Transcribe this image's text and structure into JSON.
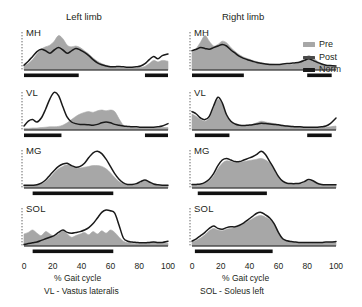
{
  "titles": {
    "left": "Left limb",
    "right": "Right limb"
  },
  "axis": {
    "xlabel": "% Gait cycle",
    "ticks": [
      "0",
      "20",
      "40",
      "60",
      "80",
      "100"
    ],
    "xlim": [
      0,
      100
    ]
  },
  "legend": {
    "position": "right",
    "items": [
      {
        "label": "Pre",
        "color": "#a7a7a7",
        "style": "filled-area"
      },
      {
        "label": "Post",
        "color": "#4a4a4a",
        "style": "line"
      },
      {
        "label": "Norm",
        "color": "#1a1a1a",
        "style": "bar"
      }
    ]
  },
  "footnotes": {
    "vl": "VL - Vastus lateralis",
    "sol": "SOL - Soleus left"
  },
  "muscles": [
    "MH",
    "VL",
    "MG",
    "SOL"
  ],
  "chart_data": {
    "type": "area",
    "xlabel": "% Gait cycle",
    "ylabel": "",
    "xlim": [
      0,
      100
    ],
    "ylim": [
      0,
      1
    ],
    "grid": false,
    "legend": [
      "Pre",
      "Post",
      "Norm"
    ],
    "panels": [
      {
        "muscle": "MH",
        "limb": "Left limb",
        "x": [
          0,
          3,
          6,
          9,
          12,
          15,
          18,
          21,
          24,
          27,
          30,
          33,
          36,
          39,
          42,
          45,
          48,
          51,
          54,
          57,
          60,
          63,
          66,
          69,
          72,
          75,
          78,
          81,
          84,
          87,
          90,
          93,
          96,
          100
        ],
        "series": [
          {
            "name": "Pre",
            "values": [
              0.1,
              0.16,
              0.26,
              0.4,
              0.52,
              0.58,
              0.62,
              0.72,
              0.86,
              0.78,
              0.62,
              0.58,
              0.6,
              0.56,
              0.48,
              0.4,
              0.3,
              0.22,
              0.16,
              0.12,
              0.09,
              0.07,
              0.06,
              0.05,
              0.05,
              0.05,
              0.05,
              0.06,
              0.09,
              0.16,
              0.24,
              0.2,
              0.24,
              0.22
            ]
          },
          {
            "name": "Post",
            "values": [
              0.12,
              0.22,
              0.34,
              0.46,
              0.52,
              0.48,
              0.42,
              0.5,
              0.56,
              0.5,
              0.42,
              0.48,
              0.54,
              0.5,
              0.44,
              0.36,
              0.26,
              0.18,
              0.13,
              0.1,
              0.08,
              0.08,
              0.09,
              0.08,
              0.07,
              0.07,
              0.08,
              0.1,
              0.16,
              0.26,
              0.34,
              0.28,
              0.36,
              0.4
            ]
          }
        ],
        "norm_bars": [
          [
            0,
            38
          ],
          [
            84,
            100
          ]
        ]
      },
      {
        "muscle": "VL",
        "limb": "Left limb",
        "x": [
          0,
          3,
          6,
          9,
          12,
          15,
          18,
          21,
          24,
          27,
          30,
          33,
          36,
          39,
          42,
          45,
          48,
          51,
          54,
          57,
          60,
          63,
          66,
          69,
          72,
          75,
          78,
          81,
          84,
          87,
          90,
          93,
          96,
          100
        ],
        "series": [
          {
            "name": "Pre",
            "values": [
              0.04,
              0.04,
              0.05,
              0.05,
              0.06,
              0.07,
              0.08,
              0.08,
              0.09,
              0.12,
              0.18,
              0.26,
              0.34,
              0.4,
              0.44,
              0.46,
              0.44,
              0.48,
              0.5,
              0.48,
              0.5,
              0.46,
              0.28,
              0.12,
              0.07,
              0.06,
              0.05,
              0.05,
              0.05,
              0.05,
              0.05,
              0.05,
              0.06,
              0.06
            ]
          },
          {
            "name": "Post",
            "values": [
              0.1,
              0.22,
              0.26,
              0.2,
              0.3,
              0.52,
              0.78,
              0.94,
              0.86,
              0.58,
              0.32,
              0.2,
              0.16,
              0.14,
              0.14,
              0.13,
              0.12,
              0.14,
              0.18,
              0.2,
              0.18,
              0.14,
              0.12,
              0.1,
              0.09,
              0.08,
              0.08,
              0.07,
              0.07,
              0.07,
              0.07,
              0.08,
              0.1,
              0.16
            ]
          }
        ],
        "norm_bars": [
          [
            0,
            26
          ],
          [
            84,
            100
          ]
        ]
      },
      {
        "muscle": "MG",
        "limb": "Left limb",
        "x": [
          0,
          3,
          6,
          9,
          12,
          15,
          18,
          21,
          24,
          27,
          30,
          33,
          36,
          39,
          42,
          45,
          48,
          51,
          54,
          57,
          60,
          63,
          66,
          69,
          72,
          75,
          78,
          81,
          84,
          87,
          90,
          93,
          96,
          100
        ],
        "series": [
          {
            "name": "Pre",
            "values": [
              0.06,
              0.06,
              0.06,
              0.07,
              0.1,
              0.16,
              0.26,
              0.38,
              0.48,
              0.54,
              0.58,
              0.54,
              0.5,
              0.5,
              0.52,
              0.54,
              0.56,
              0.56,
              0.54,
              0.48,
              0.38,
              0.26,
              0.16,
              0.1,
              0.08,
              0.08,
              0.1,
              0.14,
              0.18,
              0.14,
              0.09,
              0.07,
              0.06,
              0.06
            ]
          },
          {
            "name": "Post",
            "values": [
              0.07,
              0.07,
              0.07,
              0.08,
              0.12,
              0.2,
              0.32,
              0.44,
              0.54,
              0.6,
              0.62,
              0.56,
              0.52,
              0.54,
              0.62,
              0.76,
              0.88,
              0.92,
              0.86,
              0.72,
              0.54,
              0.36,
              0.22,
              0.13,
              0.09,
              0.09,
              0.11,
              0.16,
              0.2,
              0.15,
              0.1,
              0.08,
              0.07,
              0.07
            ]
          }
        ],
        "norm_bars": [
          [
            6,
            62
          ]
        ]
      },
      {
        "muscle": "SOL",
        "limb": "Left limb",
        "x": [
          0,
          3,
          6,
          9,
          12,
          15,
          18,
          21,
          24,
          27,
          30,
          33,
          36,
          39,
          42,
          45,
          48,
          51,
          54,
          57,
          60,
          63,
          66,
          69,
          72,
          75,
          78,
          81,
          84,
          87,
          90,
          93,
          96,
          100
        ],
        "series": [
          {
            "name": "Pre",
            "values": [
              0.3,
              0.34,
              0.4,
              0.32,
              0.26,
              0.36,
              0.3,
              0.24,
              0.3,
              0.38,
              0.3,
              0.22,
              0.26,
              0.3,
              0.34,
              0.28,
              0.36,
              0.3,
              0.38,
              0.32,
              0.4,
              0.34,
              0.22,
              0.12,
              0.08,
              0.07,
              0.06,
              0.06,
              0.06,
              0.08,
              0.1,
              0.08,
              0.07,
              0.07
            ]
          },
          {
            "name": "Post",
            "values": [
              0.04,
              0.06,
              0.08,
              0.1,
              0.14,
              0.18,
              0.22,
              0.26,
              0.34,
              0.4,
              0.34,
              0.32,
              0.34,
              0.36,
              0.4,
              0.46,
              0.56,
              0.7,
              0.84,
              0.9,
              0.88,
              0.82,
              0.52,
              0.2,
              0.12,
              0.1,
              0.09,
              0.08,
              0.08,
              0.09,
              0.1,
              0.09,
              0.09,
              0.12
            ]
          }
        ],
        "norm_bars": [
          [
            6,
            62
          ]
        ]
      },
      {
        "muscle": "MH",
        "limb": "Right limb",
        "x": [
          0,
          3,
          6,
          9,
          12,
          15,
          18,
          21,
          24,
          27,
          30,
          33,
          36,
          39,
          42,
          45,
          48,
          51,
          54,
          57,
          60,
          63,
          66,
          69,
          72,
          75,
          78,
          81,
          84,
          87,
          90,
          93,
          96,
          100
        ],
        "series": [
          {
            "name": "Pre",
            "values": [
              0.44,
              0.54,
              0.7,
              0.86,
              0.72,
              0.6,
              0.64,
              0.72,
              0.68,
              0.56,
              0.46,
              0.38,
              0.32,
              0.28,
              0.24,
              0.21,
              0.18,
              0.16,
              0.15,
              0.14,
              0.13,
              0.13,
              0.13,
              0.14,
              0.16,
              0.2,
              0.28,
              0.36,
              0.3,
              0.22,
              0.16,
              0.12,
              0.1,
              0.09
            ]
          },
          {
            "name": "Post",
            "values": [
              0.48,
              0.52,
              0.56,
              0.54,
              0.52,
              0.56,
              0.6,
              0.64,
              0.6,
              0.5,
              0.42,
              0.34,
              0.29,
              0.25,
              0.22,
              0.19,
              0.17,
              0.15,
              0.14,
              0.14,
              0.14,
              0.15,
              0.16,
              0.17,
              0.18,
              0.2,
              0.24,
              0.28,
              0.24,
              0.19,
              0.15,
              0.12,
              0.11,
              0.1
            ]
          }
        ],
        "norm_bars": [
          [
            0,
            36
          ],
          [
            80,
            97
          ]
        ]
      },
      {
        "muscle": "VL",
        "limb": "Right limb",
        "x": [
          0,
          3,
          6,
          9,
          12,
          15,
          18,
          21,
          24,
          27,
          30,
          33,
          36,
          39,
          42,
          45,
          48,
          51,
          54,
          57,
          60,
          63,
          66,
          69,
          72,
          75,
          78,
          81,
          84,
          87,
          90,
          93,
          96,
          100
        ],
        "series": [
          {
            "name": "Pre",
            "values": [
              0.4,
              0.34,
              0.26,
              0.22,
              0.3,
              0.54,
              0.76,
              0.64,
              0.36,
              0.2,
              0.14,
              0.12,
              0.11,
              0.12,
              0.14,
              0.18,
              0.22,
              0.2,
              0.18,
              0.16,
              0.14,
              0.12,
              0.1,
              0.09,
              0.08,
              0.07,
              0.07,
              0.06,
              0.06,
              0.06,
              0.06,
              0.07,
              0.08,
              0.1
            ]
          },
          {
            "name": "Post",
            "values": [
              0.46,
              0.4,
              0.3,
              0.26,
              0.34,
              0.6,
              0.82,
              0.68,
              0.38,
              0.22,
              0.15,
              0.12,
              0.11,
              0.12,
              0.13,
              0.15,
              0.17,
              0.16,
              0.15,
              0.14,
              0.13,
              0.11,
              0.1,
              0.09,
              0.08,
              0.08,
              0.07,
              0.07,
              0.07,
              0.07,
              0.08,
              0.1,
              0.16,
              0.3
            ]
          }
        ],
        "norm_bars": [
          [
            2,
            26
          ],
          [
            80,
            97
          ]
        ]
      },
      {
        "muscle": "MG",
        "limb": "Right limb",
        "x": [
          0,
          3,
          6,
          9,
          12,
          15,
          18,
          21,
          24,
          27,
          30,
          33,
          36,
          39,
          42,
          45,
          48,
          51,
          54,
          57,
          60,
          63,
          66,
          69,
          72,
          75,
          78,
          81,
          84,
          87,
          90,
          93,
          96,
          100
        ],
        "series": [
          {
            "name": "Pre",
            "values": [
              0.08,
              0.08,
              0.09,
              0.12,
              0.18,
              0.3,
              0.48,
              0.62,
              0.68,
              0.66,
              0.64,
              0.64,
              0.66,
              0.68,
              0.7,
              0.72,
              0.74,
              0.7,
              0.62,
              0.46,
              0.28,
              0.16,
              0.11,
              0.1,
              0.1,
              0.11,
              0.14,
              0.18,
              0.16,
              0.11,
              0.08,
              0.07,
              0.07,
              0.07
            ]
          },
          {
            "name": "Post",
            "values": [
              0.09,
              0.09,
              0.1,
              0.14,
              0.22,
              0.36,
              0.56,
              0.7,
              0.74,
              0.7,
              0.66,
              0.66,
              0.7,
              0.74,
              0.78,
              0.84,
              0.92,
              0.84,
              0.66,
              0.48,
              0.29,
              0.17,
              0.12,
              0.11,
              0.11,
              0.12,
              0.16,
              0.21,
              0.18,
              0.12,
              0.09,
              0.08,
              0.08,
              0.08
            ]
          }
        ],
        "norm_bars": [
          [
            4,
            52
          ]
        ]
      },
      {
        "muscle": "SOL",
        "limb": "Right limb",
        "x": [
          0,
          3,
          6,
          9,
          12,
          15,
          18,
          21,
          24,
          27,
          30,
          33,
          36,
          39,
          42,
          45,
          48,
          51,
          54,
          57,
          60,
          63,
          66,
          69,
          72,
          75,
          78,
          81,
          84,
          87,
          90,
          93,
          96,
          100
        ],
        "series": [
          {
            "name": "Pre",
            "values": [
              0.1,
              0.14,
              0.2,
              0.28,
              0.38,
              0.44,
              0.4,
              0.38,
              0.42,
              0.44,
              0.46,
              0.5,
              0.56,
              0.62,
              0.68,
              0.74,
              0.76,
              0.72,
              0.66,
              0.54,
              0.34,
              0.18,
              0.12,
              0.1,
              0.09,
              0.08,
              0.08,
              0.08,
              0.08,
              0.08,
              0.08,
              0.08,
              0.09,
              0.09
            ]
          },
          {
            "name": "Post",
            "values": [
              0.12,
              0.18,
              0.26,
              0.34,
              0.44,
              0.5,
              0.44,
              0.42,
              0.46,
              0.48,
              0.48,
              0.52,
              0.58,
              0.66,
              0.74,
              0.82,
              0.84,
              0.78,
              0.7,
              0.56,
              0.34,
              0.18,
              0.13,
              0.11,
              0.1,
              0.09,
              0.09,
              0.09,
              0.09,
              0.09,
              0.09,
              0.1,
              0.1,
              0.11
            ]
          }
        ],
        "norm_bars": [
          [
            2,
            56
          ]
        ]
      }
    ]
  }
}
